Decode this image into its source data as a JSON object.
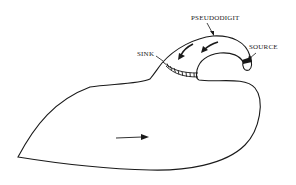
{
  "diagram": {
    "type": "anatomical-schematic",
    "labels": {
      "pseudodigit": "PSEUDODIGIT",
      "sink": "SINK",
      "source": "SOURCE"
    },
    "arrows": [
      {
        "name": "body-movement-arrow",
        "direction": "right"
      },
      {
        "name": "pseudodigit-flow-arrow-1",
        "direction": "down-left"
      },
      {
        "name": "pseudodigit-flow-arrow-2",
        "direction": "down-left"
      }
    ],
    "colors": {
      "stroke": "#1a1a1a",
      "background": "#ffffff"
    }
  }
}
